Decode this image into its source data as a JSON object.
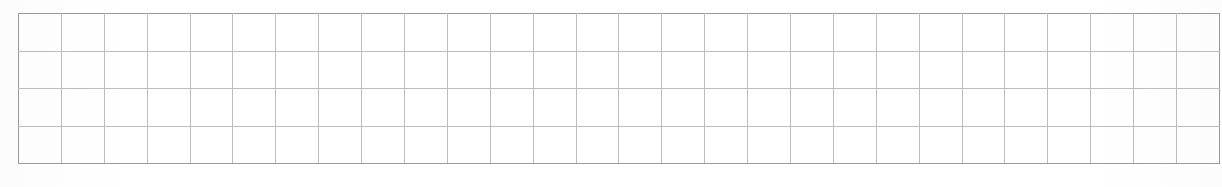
{
  "page": {
    "background_color": "#ffffff",
    "width": 1222,
    "height": 187
  },
  "grid": {
    "name": "empty-grid-table",
    "columns": 28,
    "rows": 4,
    "cell_width": 41.9,
    "cell_height": 37.5,
    "origin_x": 18,
    "origin_y": 13,
    "total_width": 1172,
    "total_height": 150,
    "line_color": "#bdbdbd",
    "border_color": "#9b9b9b",
    "cell_background": "#ffffff",
    "has_header_row": false,
    "has_content": false,
    "column_headers": [],
    "row_labels": [],
    "cells": [
      [
        "",
        "",
        "",
        "",
        "",
        "",
        "",
        "",
        "",
        "",
        "",
        "",
        "",
        "",
        "",
        "",
        "",
        "",
        "",
        "",
        "",
        "",
        "",
        "",
        "",
        "",
        "",
        ""
      ],
      [
        "",
        "",
        "",
        "",
        "",
        "",
        "",
        "",
        "",
        "",
        "",
        "",
        "",
        "",
        "",
        "",
        "",
        "",
        "",
        "",
        "",
        "",
        "",
        "",
        "",
        "",
        "",
        ""
      ],
      [
        "",
        "",
        "",
        "",
        "",
        "",
        "",
        "",
        "",
        "",
        "",
        "",
        "",
        "",
        "",
        "",
        "",
        "",
        "",
        "",
        "",
        "",
        "",
        "",
        "",
        "",
        "",
        ""
      ],
      [
        "",
        "",
        "",
        "",
        "",
        "",
        "",
        "",
        "",
        "",
        "",
        "",
        "",
        "",
        "",
        "",
        "",
        "",
        "",
        "",
        "",
        "",
        "",
        "",
        "",
        "",
        "",
        ""
      ]
    ]
  }
}
